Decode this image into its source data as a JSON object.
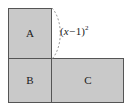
{
  "figure": {
    "background_color": "#ffffff",
    "fill_color": "#c9c9c9",
    "stroke_color": "#555555",
    "dash_color": "#999999",
    "text_color": "#1a1a1a",
    "width": 131,
    "height": 112
  },
  "regions": [
    {
      "id": "A",
      "label": "A",
      "x": 8,
      "y": 8,
      "width": 44,
      "height": 51,
      "label_x": 30,
      "label_y": 34
    },
    {
      "id": "B",
      "label": "B",
      "x": 8,
      "y": 59,
      "width": 44,
      "height": 44,
      "label_x": 30,
      "label_y": 81
    },
    {
      "id": "C",
      "label": "C",
      "x": 52,
      "y": 59,
      "width": 72,
      "height": 44,
      "label_x": 88,
      "label_y": 81
    }
  ],
  "annotation": {
    "expression_plain": "(x-1)^2",
    "open_paren": "(",
    "variable": "x",
    "operator": "−",
    "constant": "1",
    "close_paren": ")",
    "exponent": "2",
    "text_x": 60,
    "text_y": 32,
    "brace_top_x": 52,
    "brace_top_y": 8,
    "brace_bottom_x": 52,
    "brace_bottom_y": 59,
    "brace_peak_x": 64,
    "dash_pattern": "2,2"
  }
}
